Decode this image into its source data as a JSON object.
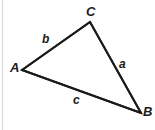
{
  "figure": {
    "type": "geometry-diagram",
    "shape": "triangle",
    "background_color": "#ffffff",
    "stroke_color": "#1b1b1b",
    "label_color": "#1b1b1b",
    "rule_color": "#d8d8d8",
    "width": 155,
    "height": 130
  },
  "vertices": [
    {
      "id": "A",
      "label": "A",
      "x": 22,
      "y": 70
    },
    {
      "id": "B",
      "label": "B",
      "x": 141,
      "y": 113
    },
    {
      "id": "C",
      "label": "C",
      "x": 90,
      "y": 22
    }
  ],
  "sides": [
    {
      "id": "a",
      "label": "a",
      "from": "C",
      "to": "B"
    },
    {
      "id": "b",
      "label": "b",
      "from": "A",
      "to": "C"
    },
    {
      "id": "c",
      "label": "c",
      "from": "A",
      "to": "B"
    }
  ]
}
